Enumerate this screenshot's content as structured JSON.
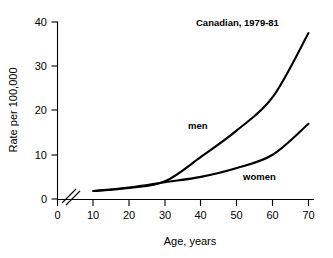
{
  "chart_data": {
    "type": "line",
    "title": "Canadian, 1979-81",
    "xlabel": "Age, years",
    "ylabel": "Rate per 100,000",
    "xlim": [
      0,
      70
    ],
    "ylim": [
      0,
      40
    ],
    "xticks": [
      0,
      10,
      20,
      30,
      40,
      50,
      60,
      70
    ],
    "yticks": [
      0,
      10,
      20,
      30,
      40
    ],
    "grid": false,
    "legend": "inline-labels",
    "axis_break": {
      "axis": "x",
      "between": [
        0,
        10
      ],
      "symbol": "double-slash"
    },
    "x": [
      10,
      20,
      30,
      40,
      50,
      60,
      70
    ],
    "series": [
      {
        "name": "men",
        "label": "men",
        "color": "#000000",
        "values": [
          1.8,
          2.5,
          4.0,
          9.5,
          15.5,
          23.0,
          37.5
        ],
        "label_x": 45,
        "label_y": 18.0
      },
      {
        "name": "women",
        "label": "women",
        "color": "#000000",
        "values": [
          1.8,
          2.6,
          3.8,
          5.0,
          7.0,
          10.0,
          17.0
        ],
        "label_x": 63,
        "label_y": 6.2
      }
    ],
    "title_x": 37,
    "title_y": 38.5
  },
  "figure": {
    "title": "Canadian, 1979-81",
    "xlabel": "Age, years",
    "ylabel": "Rate per 100,000",
    "xticks": [
      "0",
      "10",
      "20",
      "30",
      "40",
      "50",
      "60",
      "70"
    ],
    "yticks": [
      "0",
      "10",
      "20",
      "30",
      "40"
    ],
    "series_labels": [
      "men",
      "women"
    ],
    "background_color": "#ffffff",
    "line_color": "#000000"
  }
}
